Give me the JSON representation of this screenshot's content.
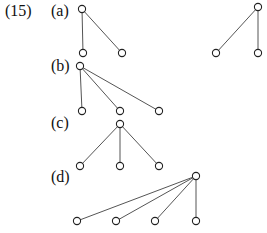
{
  "figure": {
    "number_label": "(15)",
    "parts": [
      {
        "label": "(a)",
        "trees": [
          {
            "root": [
              82,
              9
            ],
            "children": [
              [
                83,
                53
              ],
              [
                122,
                53
              ]
            ]
          },
          {
            "root": [
              258,
              7
            ],
            "children": [
              [
                216,
                53
              ],
              [
                258,
                53
              ]
            ]
          }
        ]
      },
      {
        "label": "(b)",
        "trees": [
          {
            "root": [
              80,
              66
            ],
            "children": [
              [
                82,
                111
              ],
              [
                120,
                111
              ],
              [
                159,
                111
              ]
            ]
          }
        ]
      },
      {
        "label": "(c)",
        "trees": [
          {
            "root": [
              120,
              124
            ],
            "children": [
              [
                80,
                166
              ],
              [
                120,
                166
              ],
              [
                159,
                166
              ]
            ]
          }
        ]
      },
      {
        "label": "(d)",
        "trees": [
          {
            "root": [
              196,
              176
            ],
            "children": [
              [
                77,
                221
              ],
              [
                116,
                221
              ],
              [
                155,
                221
              ],
              [
                196,
                221
              ]
            ]
          }
        ]
      }
    ],
    "colors": {
      "edge": "#555555",
      "node_stroke": "#222222",
      "node_fill": "#ffffff"
    }
  }
}
